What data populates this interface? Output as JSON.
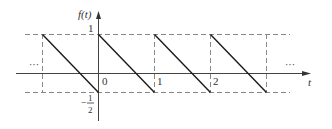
{
  "diagram": {
    "type": "periodic sawtooth waveform",
    "y_axis_label": "f(t)",
    "x_axis_label": "t",
    "y_tick_top": "1",
    "y_tick_bottom_num": "1",
    "y_tick_bottom_den": "2",
    "y_tick_bottom_sign": "−",
    "x_ticks": [
      "0",
      "1",
      "2"
    ],
    "ellipsis_left": "···",
    "ellipsis_right": "···",
    "period": 1,
    "max_value": 1,
    "min_value": -0.5,
    "segments": [
      {
        "t_start": -1,
        "t_end": 0,
        "f_start": 1,
        "f_end": -0.5
      },
      {
        "t_start": 0,
        "t_end": 1,
        "f_start": 1,
        "f_end": -0.5
      },
      {
        "t_start": 1,
        "t_end": 2,
        "f_start": 1,
        "f_end": -0.5
      },
      {
        "t_start": 2,
        "t_end": 3,
        "f_start": 1,
        "f_end": -0.5
      }
    ],
    "colors": {
      "waveform": "#1a1a1a",
      "axis": "#444444",
      "dashed": "#777777",
      "text": "#333333"
    }
  }
}
